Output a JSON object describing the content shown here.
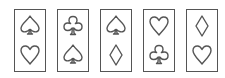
{
  "puzzle": {
    "cards": [
      {
        "top": "spade",
        "bottom": "heart"
      },
      {
        "top": "club",
        "bottom": "spade"
      },
      {
        "top": "spade",
        "bottom": "diamond"
      },
      {
        "top": "heart",
        "bottom": "club"
      },
      {
        "top": "diamond",
        "bottom": "heart"
      }
    ],
    "colors": {
      "outline": "#555555",
      "background": "#ffffff"
    }
  }
}
